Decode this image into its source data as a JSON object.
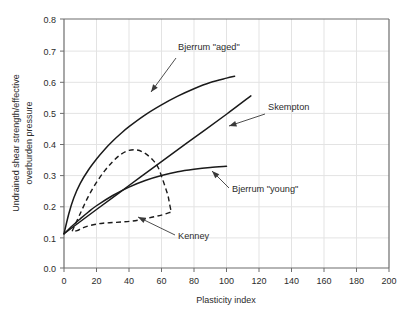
{
  "chart_data": {
    "type": "line",
    "title": "",
    "xlabel": "Plasticity index",
    "ylabel": "Undrained shear strength/effective overburden pressure",
    "ylabel_line1": "Undrained shear strength/effective",
    "ylabel_line2": "overburden pressure",
    "xlim": [
      0,
      200
    ],
    "ylim": [
      0.0,
      0.8
    ],
    "xticks": [
      0,
      20,
      40,
      60,
      80,
      100,
      120,
      140,
      160,
      180,
      200
    ],
    "yticks": [
      0.0,
      0.1,
      0.2,
      0.3,
      0.4,
      0.5,
      0.6,
      0.7,
      0.8
    ],
    "xtick_labels": [
      "0",
      "20",
      "40",
      "60",
      "80",
      "100",
      "120",
      "140",
      "160",
      "180",
      "200"
    ],
    "ytick_labels": [
      "0.0",
      "0.1",
      "0.2",
      "0.3",
      "0.4",
      "0.5",
      "0.6",
      "0.7",
      "0.8"
    ],
    "grid": true,
    "legend_position": "inline-annotations",
    "series": [
      {
        "name": "Bjerrum \"aged\"",
        "style": "solid",
        "color": "#1a1a1a",
        "points": [
          [
            0,
            0.11
          ],
          [
            3,
            0.175
          ],
          [
            6,
            0.225
          ],
          [
            10,
            0.272
          ],
          [
            15,
            0.315
          ],
          [
            20,
            0.35
          ],
          [
            25,
            0.381
          ],
          [
            30,
            0.408
          ],
          [
            35,
            0.432
          ],
          [
            40,
            0.454
          ],
          [
            50,
            0.492
          ],
          [
            60,
            0.524
          ],
          [
            70,
            0.552
          ],
          [
            80,
            0.576
          ],
          [
            90,
            0.596
          ],
          [
            100,
            0.61
          ],
          [
            105,
            0.616
          ]
        ]
      },
      {
        "name": "Skempton",
        "style": "solid",
        "color": "#1a1a1a",
        "points": [
          [
            0,
            0.11
          ],
          [
            20,
            0.188
          ],
          [
            40,
            0.265
          ],
          [
            60,
            0.342
          ],
          [
            80,
            0.418
          ],
          [
            100,
            0.494
          ],
          [
            115,
            0.553
          ]
        ]
      },
      {
        "name": "Bjerrum \"young\"",
        "style": "solid",
        "color": "#1a1a1a",
        "points": [
          [
            0,
            0.11
          ],
          [
            5,
            0.135
          ],
          [
            10,
            0.158
          ],
          [
            15,
            0.18
          ],
          [
            20,
            0.2
          ],
          [
            30,
            0.233
          ],
          [
            40,
            0.26
          ],
          [
            50,
            0.281
          ],
          [
            60,
            0.297
          ],
          [
            70,
            0.309
          ],
          [
            80,
            0.317
          ],
          [
            90,
            0.323
          ],
          [
            100,
            0.327
          ]
        ]
      },
      {
        "name": "Kenney",
        "style": "dashed",
        "color": "#1a1a1a",
        "closed_loop": true,
        "upper_branch": [
          [
            5,
            0.118
          ],
          [
            10,
            0.175
          ],
          [
            15,
            0.23
          ],
          [
            20,
            0.275
          ],
          [
            25,
            0.312
          ],
          [
            30,
            0.342
          ],
          [
            35,
            0.365
          ],
          [
            40,
            0.378
          ],
          [
            45,
            0.379
          ],
          [
            50,
            0.368
          ],
          [
            55,
            0.345
          ],
          [
            58,
            0.322
          ],
          [
            60,
            0.295
          ],
          [
            62,
            0.265
          ],
          [
            64,
            0.232
          ],
          [
            65,
            0.205
          ],
          [
            66,
            0.18
          ]
        ],
        "lower_branch": [
          [
            5,
            0.118
          ],
          [
            8,
            0.12
          ],
          [
            12,
            0.13
          ],
          [
            18,
            0.139
          ],
          [
            24,
            0.144
          ],
          [
            30,
            0.146
          ],
          [
            36,
            0.148
          ],
          [
            42,
            0.151
          ],
          [
            48,
            0.156
          ],
          [
            54,
            0.163
          ],
          [
            60,
            0.17
          ],
          [
            66,
            0.18
          ]
        ]
      }
    ],
    "annotations": [
      {
        "id": "annot-bjerrum-aged",
        "text": "Bjerrum \"aged\"",
        "label_xy": [
          178,
          50
        ],
        "arrow_from": [
          176,
          58
        ],
        "arrow_to": [
          151,
          92
        ]
      },
      {
        "id": "annot-skempton",
        "text": "Skempton",
        "label_xy": [
          268,
          110
        ],
        "arrow_from": [
          265,
          114
        ],
        "arrow_to": [
          229,
          126
        ]
      },
      {
        "id": "annot-bjerrum-young",
        "text": "Bjerrum \"young\"",
        "label_xy": [
          232,
          192
        ],
        "arrow_from": [
          229,
          188
        ],
        "arrow_to": [
          212,
          171
        ]
      },
      {
        "id": "annot-kenney",
        "text": "Kenney",
        "label_xy": [
          178,
          239
        ],
        "arrow_from": [
          175,
          235
        ],
        "arrow_to": [
          138,
          217
        ]
      }
    ]
  }
}
